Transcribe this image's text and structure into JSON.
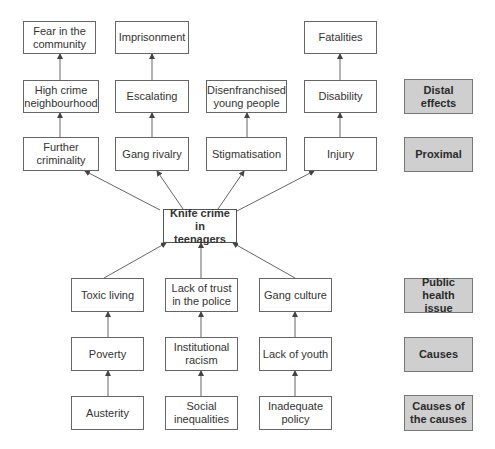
{
  "diagram": {
    "title": "Knife crime in teenagers",
    "center": {
      "label": "Knife crime\nin teenagers"
    },
    "effects": {
      "distal_top": [
        {
          "id": "fear",
          "label": "Fear in the community"
        },
        {
          "id": "imprisonment",
          "label": "Imprisonment"
        },
        {
          "id": "fatalities",
          "label": "Fatalities"
        }
      ],
      "distal": [
        {
          "id": "high-crime",
          "label": "High crime neighbourhood"
        },
        {
          "id": "escalating",
          "label": "Escalating"
        },
        {
          "id": "disenfranchised",
          "label": "Disenfranchised young people"
        },
        {
          "id": "disability",
          "label": "Disability"
        }
      ],
      "proximal": [
        {
          "id": "further-criminality",
          "label": "Further criminality"
        },
        {
          "id": "gang-rivalry",
          "label": "Gang rivalry"
        },
        {
          "id": "stigmatisation",
          "label": "Stigmatisation"
        },
        {
          "id": "injury",
          "label": "Injury"
        }
      ]
    },
    "causes": {
      "public_health": [
        {
          "id": "toxic-living",
          "label": "Toxic living"
        },
        {
          "id": "lack-of-trust",
          "label": "Lack of trust in the police"
        },
        {
          "id": "gang-culture",
          "label": "Gang culture"
        }
      ],
      "causes": [
        {
          "id": "poverty",
          "label": "Poverty"
        },
        {
          "id": "institutional-racism",
          "label": "Institutional racism"
        },
        {
          "id": "lack-of-youth",
          "label": "Lack of youth"
        }
      ],
      "causes_of_causes": [
        {
          "id": "austerity",
          "label": "Austerity"
        },
        {
          "id": "social-inequalities",
          "label": "Social inequalities"
        },
        {
          "id": "inadequate-policy",
          "label": "Inadequate policy"
        }
      ]
    },
    "level_labels": {
      "distal": "Distal effects",
      "proximal": "Proximal",
      "public_health": "Public health issue",
      "causes": "Causes",
      "causes_of_causes": "Causes of the causes"
    },
    "colors": {
      "box_border": "#666666",
      "label_fill": "#cfcfcf",
      "arrow": "#555555"
    }
  }
}
